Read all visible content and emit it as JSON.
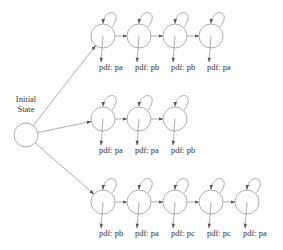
{
  "diagram": {
    "type": "state-machine",
    "initial_state": {
      "label_line1": "Initial",
      "label_line2": "State"
    },
    "chains": [
      {
        "name": "chain-1",
        "states": [
          {
            "pdf_label": "pdf: pa"
          },
          {
            "pdf_label": "pdf: pb"
          },
          {
            "pdf_label": "pdf: pb"
          },
          {
            "pdf_label": "pdf: pa"
          }
        ]
      },
      {
        "name": "chain-2",
        "states": [
          {
            "pdf_label": "pdf: pa"
          },
          {
            "pdf_label": "pdf: pa"
          },
          {
            "pdf_label": "pdf: pb"
          }
        ]
      },
      {
        "name": "chain-3",
        "states": [
          {
            "pdf_label": "pdf: pb"
          },
          {
            "pdf_label": "pdf: pa"
          },
          {
            "pdf_label": "pdf: pc"
          },
          {
            "pdf_label": "pdf: pc"
          },
          {
            "pdf_label": "pdf: pa"
          }
        ]
      }
    ],
    "colors": {
      "stroke": "#8c8c8c",
      "text": "#333333",
      "background": "#ffffff"
    }
  }
}
